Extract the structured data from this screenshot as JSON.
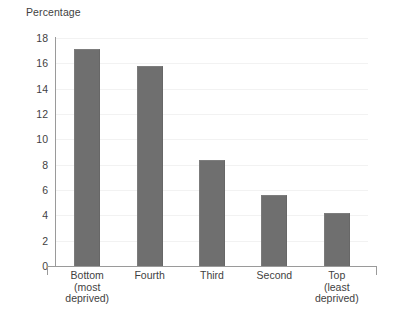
{
  "chart_data": {
    "type": "bar",
    "title": "Percentage",
    "xlabel": "",
    "ylabel": "",
    "categories": [
      "Bottom\n(most\ndeprived)",
      "Fourth",
      "Third",
      "Second",
      "Top\n(least\ndeprived)"
    ],
    "category_lines": [
      [
        "Bottom",
        "(most",
        "deprived)"
      ],
      [
        "Fourth"
      ],
      [
        "Third"
      ],
      [
        "Second"
      ],
      [
        "Top",
        "(least",
        "deprived)"
      ]
    ],
    "values": [
      17.1,
      15.8,
      8.4,
      5.6,
      4.2
    ],
    "ylim": [
      0,
      18
    ],
    "ytick_step": 2,
    "yticks": [
      0,
      2,
      4,
      6,
      8,
      10,
      12,
      14,
      16,
      18
    ],
    "ytick_labels": [
      "0",
      "2",
      "4",
      "6",
      "8",
      "10",
      "12",
      "14",
      "16",
      "18"
    ],
    "grid": true,
    "legend": false,
    "bar_color": "#6f6f6f",
    "axis_color": "#9a9a9a",
    "grid_color": "#f2f2f2",
    "text_color": "#3f3f3f",
    "background": "#ffffff"
  }
}
